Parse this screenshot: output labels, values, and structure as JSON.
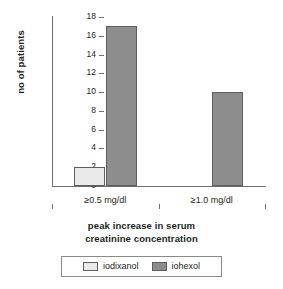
{
  "chart_data": {
    "type": "bar",
    "title": "",
    "xlabel": "peak increase in serum creatinine concentration",
    "xlabel_line1": "peak increase in serum",
    "xlabel_line2": "creatinine concentration",
    "ylabel": "no of patients",
    "categories": [
      "≥0.5 mg/dl",
      "≥1.0 mg/dl"
    ],
    "series": [
      {
        "name": "iodixanol",
        "values": [
          2,
          0
        ],
        "color": "#eaeaea"
      },
      {
        "name": "iohexol",
        "values": [
          17,
          10
        ],
        "color": "#8d8d8d"
      }
    ],
    "ylim": [
      0,
      18
    ],
    "ytick_step": 2,
    "yticks": [
      0,
      2,
      4,
      6,
      8,
      10,
      12,
      14,
      16,
      18
    ],
    "ytick_labels": [
      "0",
      "2",
      "4",
      "6",
      "8",
      "10",
      "12",
      "14",
      "16",
      "18"
    ],
    "grid": false,
    "legend_position": "bottom",
    "axis_color": "#6e6e6e",
    "bar_edge_color": "#5e5e5e"
  }
}
